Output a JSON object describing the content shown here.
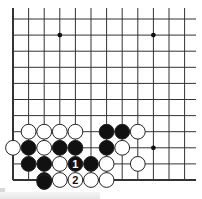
{
  "diagram": {
    "board": {
      "columns": 12,
      "rows": 11,
      "edges": [
        "left",
        "bottom"
      ],
      "line_color": "#333333",
      "star_points": [
        {
          "col": 3,
          "row": 1
        },
        {
          "col": 9,
          "row": 1
        },
        {
          "col": 9,
          "row": 8
        }
      ]
    },
    "stones": [
      {
        "color": "white",
        "col": 1,
        "row": 7
      },
      {
        "color": "white",
        "col": 2,
        "row": 7
      },
      {
        "color": "white",
        "col": 3,
        "row": 7
      },
      {
        "color": "white",
        "col": 4,
        "row": 7
      },
      {
        "color": "black",
        "col": 6,
        "row": 7
      },
      {
        "color": "black",
        "col": 7,
        "row": 7
      },
      {
        "color": "white",
        "col": 8,
        "row": 7
      },
      {
        "color": "white",
        "col": 0,
        "row": 8
      },
      {
        "color": "black",
        "col": 1,
        "row": 8
      },
      {
        "color": "white",
        "col": 2,
        "row": 8
      },
      {
        "color": "black",
        "col": 3,
        "row": 8
      },
      {
        "color": "black",
        "col": 4,
        "row": 8
      },
      {
        "color": "black",
        "col": 6,
        "row": 8
      },
      {
        "color": "white",
        "col": 7,
        "row": 8
      },
      {
        "color": "black",
        "col": 1,
        "row": 9
      },
      {
        "color": "black",
        "col": 2,
        "row": 9
      },
      {
        "color": "white",
        "col": 3,
        "row": 9
      },
      {
        "color": "black",
        "col": 4,
        "row": 9,
        "label": "1"
      },
      {
        "color": "black",
        "col": 5,
        "row": 9
      },
      {
        "color": "white",
        "col": 6,
        "row": 9
      },
      {
        "color": "white",
        "col": 8,
        "row": 9
      },
      {
        "color": "black",
        "col": 2,
        "row": 10
      },
      {
        "color": "white",
        "col": 3,
        "row": 10
      },
      {
        "color": "white",
        "col": 4,
        "row": 10,
        "label": "2"
      },
      {
        "color": "white",
        "col": 5,
        "row": 10
      },
      {
        "color": "white",
        "col": 6,
        "row": 10
      },
      {
        "color": "black",
        "col": 2,
        "row": 11
      }
    ]
  }
}
